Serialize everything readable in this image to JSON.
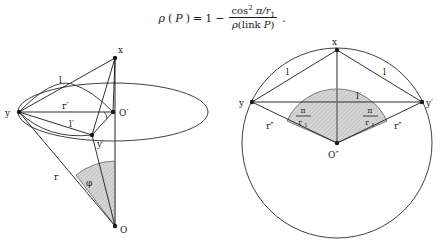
{
  "figure": {
    "background_color": "#ffffff",
    "ink_color": "#1a1a1a",
    "shade_color": "#c9c9c9",
    "formula": {
      "lhs_rho": "ρ",
      "lhs_open": "(",
      "lhs_arg": "P",
      "lhs_close": ")",
      "equals": "=",
      "one": "1",
      "minus": "−",
      "numerator_cos": "cos",
      "numerator_exp": "2",
      "numerator_rest": "π/r",
      "numerator_sub": "1",
      "denominator_rho": "ρ",
      "denominator_open": "(",
      "denominator_link": "link",
      "denominator_arg": "P",
      "denominator_close": ")",
      "period": "."
    },
    "left_diagram": {
      "name": "cone-with-elliptical-base",
      "points": [
        {
          "id": "x",
          "label": "x",
          "cx": 115,
          "cy": 58,
          "label_x": 118,
          "label_y": 53
        },
        {
          "id": "y",
          "label": "y",
          "cx": 19,
          "cy": 112,
          "label_x": 7,
          "label_y": 116
        },
        {
          "id": "Op",
          "label": "O′",
          "cx": 113,
          "cy": 112,
          "label_x": 119,
          "label_y": 116
        },
        {
          "id": "yp",
          "label": "y′",
          "cx": 92,
          "cy": 135,
          "label_x": 97,
          "label_y": 146
        },
        {
          "id": "O",
          "label": "O",
          "cx": 115,
          "cy": 226,
          "label_x": 120,
          "label_y": 232
        }
      ],
      "segment_labels": [
        {
          "id": "l",
          "label": "l",
          "x": 61,
          "y": 82
        },
        {
          "id": "r-prime",
          "label": "r′",
          "x": 66,
          "y": 108
        },
        {
          "id": "l-prime",
          "label": "l′",
          "x": 73,
          "y": 125
        },
        {
          "id": "r",
          "label": "r",
          "x": 56,
          "y": 178
        },
        {
          "id": "phi",
          "label": "φ",
          "x": 88,
          "y": 184
        }
      ],
      "ellipse": {
        "cx": 113,
        "cy": 112,
        "rx": 95,
        "ry": 29
      }
    },
    "right_diagram": {
      "name": "circle-with-inscribed-rhombus",
      "circle": {
        "cx": 337,
        "cy": 143,
        "r": 95
      },
      "points": [
        {
          "id": "x",
          "label": "x",
          "cx": 337,
          "cy": 50,
          "label_x": 334,
          "label_y": 45
        },
        {
          "id": "y",
          "label": "y",
          "cx": 252,
          "cy": 102,
          "label_x": 241,
          "label_y": 106
        },
        {
          "id": "yp",
          "label": "y′",
          "cx": 422,
          "cy": 102,
          "label_x": 426,
          "label_y": 106
        },
        {
          "id": "Opp",
          "label": "O″",
          "cx": 337,
          "cy": 143,
          "label_x": 330,
          "label_y": 157
        }
      ],
      "segment_labels": [
        {
          "id": "l-left",
          "label": "l",
          "x": 288,
          "y": 73
        },
        {
          "id": "l-right",
          "label": "l",
          "x": 385,
          "y": 73
        },
        {
          "id": "l-prime",
          "label": "l′",
          "x": 359,
          "y": 98
        },
        {
          "id": "r-left",
          "label": "r″",
          "x": 270,
          "y": 127
        },
        {
          "id": "r-right",
          "label": "r″",
          "x": 398,
          "y": 127
        }
      ],
      "angle_labels": [
        {
          "id": "angle-left",
          "numerator": "π",
          "denominator": "r",
          "denominator_sub": "1",
          "x": 305,
          "y": 115
        },
        {
          "id": "angle-right",
          "numerator": "π",
          "denominator": "r",
          "denominator_sub": "1",
          "x": 370,
          "y": 115
        }
      ]
    }
  }
}
